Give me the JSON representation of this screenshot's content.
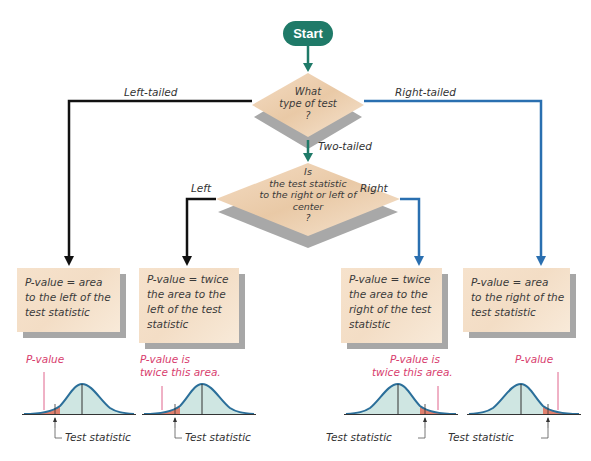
{
  "start": {
    "label": "Start",
    "color": "#1f7a68"
  },
  "decision1": {
    "lines": [
      "What",
      "type of test",
      "?"
    ]
  },
  "branches": {
    "left_tailed": "Left-tailed",
    "right_tailed": "Right-tailed",
    "two_tailed": "Two-tailed",
    "left": "Left",
    "right": "Right"
  },
  "decision2": {
    "lines": [
      "Is",
      "the test statistic",
      "to the right or left of",
      "center",
      "?"
    ]
  },
  "boxes": [
    {
      "lines": [
        "P-value = area",
        "to the left of the",
        "test statistic"
      ]
    },
    {
      "lines": [
        "P-value = twice",
        "the area to the",
        "left of the test",
        "statistic"
      ]
    },
    {
      "lines": [
        "P-value = twice",
        "the area to the",
        "right of the test",
        "statistic"
      ]
    },
    {
      "lines": [
        "P-value = area",
        "to the right of the",
        "test statistic"
      ]
    }
  ],
  "curves": [
    {
      "annotation_lines": [
        "P-value"
      ],
      "tail": "left",
      "caption": "Test statistic"
    },
    {
      "annotation_lines": [
        "P-value is",
        "twice this area."
      ],
      "tail": "left",
      "caption": "Test statistic"
    },
    {
      "annotation_lines": [
        "P-value is",
        "twice this area."
      ],
      "tail": "right",
      "caption": "Test statistic"
    },
    {
      "annotation_lines": [
        "P-value"
      ],
      "tail": "right",
      "caption": "Test statistic"
    }
  ],
  "colors": {
    "left_path": "#111111",
    "right_path": "#2a6fb0",
    "center_path": "#1f7a68",
    "tail_fill": "#e0806e",
    "body_fill": "#cfe6e2",
    "curve_line": "#2b6f9a",
    "annotation": "#d83d6e"
  }
}
